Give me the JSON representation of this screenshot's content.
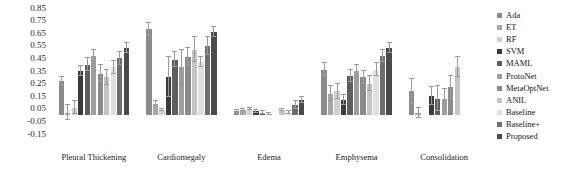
{
  "chart_data": {
    "type": "bar",
    "title": "",
    "xlabel": "",
    "ylabel": "",
    "ylim": [
      -0.15,
      0.85
    ],
    "ytick_labels": [
      "0.85",
      "0.75",
      "0.65",
      "0.55",
      "0.45",
      "0.35",
      "0.25",
      "0.15",
      "0.05",
      "-0.05",
      "-0.15"
    ],
    "ytick_values": [
      0.85,
      0.75,
      0.65,
      0.55,
      0.45,
      0.35,
      0.25,
      0.15,
      0.05,
      -0.05,
      -0.15
    ],
    "grid": false,
    "legend_position": "right",
    "categories": [
      "Pleural Thickening",
      "Cardiomegaly",
      "Edema",
      "Emphysema",
      "Consolidation"
    ],
    "series": [
      {
        "name": "Ada",
        "color": "#8c8c8c",
        "values": [
          0.27,
          0.68,
          0.03,
          0.36,
          0.19
        ],
        "errors": [
          0.03,
          0.05,
          0.01,
          0.05,
          0.1
        ]
      },
      {
        "name": "ET",
        "color": "#a8a8a8",
        "values": [
          0.02,
          0.09,
          0.04,
          0.17,
          0.02
        ],
        "errors": [
          0.06,
          0.02,
          0.01,
          0.06,
          0.04
        ]
      },
      {
        "name": "RF",
        "color": "#d0d0d0",
        "values": [
          0.06,
          0.04,
          0.05,
          0.19,
          0.0
        ],
        "errors": [
          0.05,
          0.01,
          0.01,
          0.06,
          0.0
        ]
      },
      {
        "name": "SVM",
        "color": "#3a3a3a",
        "values": [
          0.35,
          0.3,
          0.03,
          0.12,
          0.15
        ],
        "errors": [
          0.04,
          0.16,
          0.01,
          0.04,
          0.07
        ]
      },
      {
        "name": "MAML",
        "color": "#5e5e5e",
        "values": [
          0.4,
          0.44,
          0.02,
          0.31,
          0.13
        ],
        "errors": [
          0.05,
          0.06,
          0.01,
          0.05,
          0.1
        ]
      },
      {
        "name": "ProtoNet",
        "color": "#9e9e9e",
        "values": [
          0.47,
          0.38,
          0.01,
          0.35,
          0.13
        ],
        "errors": [
          0.05,
          0.14,
          0.01,
          0.05,
          0.08
        ]
      },
      {
        "name": "MetaOptNet",
        "color": "#8a8a8a",
        "values": [
          0.33,
          0.46,
          0.0,
          0.3,
          0.22
        ],
        "errors": [
          0.07,
          0.07,
          0.0,
          0.05,
          0.09
        ]
      },
      {
        "name": "ANIL",
        "color": "#c4c4c4",
        "values": [
          0.3,
          0.52,
          0.04,
          0.25,
          0.38
        ],
        "errors": [
          0.06,
          0.1,
          0.01,
          0.06,
          0.08
        ]
      },
      {
        "name": "Baseline",
        "color": "#e0e0e0",
        "values": [
          0.38,
          0.42,
          0.02,
          0.36,
          0.0
        ],
        "errors": [
          0.05,
          0.04,
          0.01,
          0.05,
          0.0
        ]
      },
      {
        "name": "Baseline+",
        "color": "#6e6e6e",
        "values": [
          0.45,
          0.55,
          0.08,
          0.47,
          0.0
        ],
        "errors": [
          0.05,
          0.07,
          0.03,
          0.05,
          0.0
        ]
      },
      {
        "name": "Proposed",
        "color": "#4a4a4a",
        "values": [
          0.53,
          0.66,
          0.12,
          0.53,
          0.0
        ],
        "errors": [
          0.04,
          0.04,
          0.02,
          0.04,
          0.0
        ]
      }
    ]
  }
}
